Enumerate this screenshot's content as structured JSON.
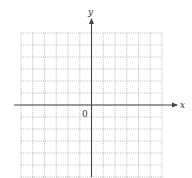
{
  "diagram": {
    "type": "coordinate-grid",
    "axes": {
      "x_label": "x",
      "y_label": "y",
      "origin_label": "0"
    },
    "grid": {
      "columns": 12,
      "rows": 12,
      "line_style": "dotted",
      "left": 21,
      "top": 33,
      "right": 162,
      "bottom": 177,
      "origin_x": 91.5,
      "origin_y": 105
    },
    "colors": {
      "grid": "#9a9a9a",
      "axis": "#444444",
      "label": "#333333"
    }
  }
}
